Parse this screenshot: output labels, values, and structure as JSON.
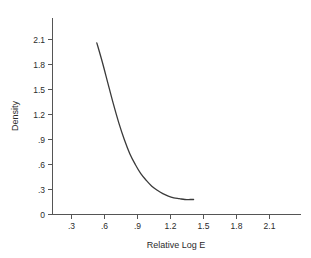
{
  "chart_data": {
    "type": "line",
    "title": "",
    "xlabel": "Relative Log E",
    "ylabel": "Density",
    "xlim": [
      0,
      2.4
    ],
    "ylim": [
      0,
      2.25
    ],
    "grid": false,
    "legend": null,
    "x_ticks": [
      ".3",
      ".6",
      ".9",
      "1.2",
      "1.5",
      "1.8",
      "2.1"
    ],
    "x_tick_values": [
      0.3,
      0.6,
      0.9,
      1.2,
      1.5,
      1.8,
      2.1
    ],
    "y_ticks": [
      "0",
      ".3",
      ".6",
      ".9",
      "1.2",
      "1.5",
      "1.8",
      "2.1"
    ],
    "y_tick_values": [
      0,
      0.3,
      0.6,
      0.9,
      1.2,
      1.5,
      1.8,
      2.1
    ],
    "series": [
      {
        "name": "Density curve",
        "x": [
          0.53,
          0.58,
          0.63,
          0.68,
          0.73,
          0.78,
          0.83,
          0.88,
          0.93,
          0.98,
          1.03,
          1.08,
          1.13,
          1.18,
          1.23,
          1.28,
          1.33,
          1.38,
          1.41
        ],
        "y": [
          2.06,
          1.83,
          1.58,
          1.33,
          1.1,
          0.9,
          0.73,
          0.6,
          0.49,
          0.41,
          0.34,
          0.29,
          0.25,
          0.22,
          0.2,
          0.19,
          0.18,
          0.18,
          0.18
        ],
        "color": "#3a3a3a"
      }
    ]
  },
  "axis": {
    "x_title": "Relative Log E",
    "y_title": "Density"
  }
}
